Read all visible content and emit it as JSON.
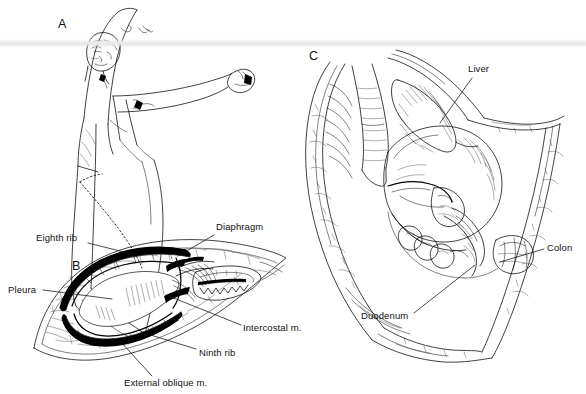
{
  "figure": {
    "kind": "medical-illustration",
    "background_color": "#ffffff",
    "ink_color": "#111111",
    "width": 586,
    "height": 394
  },
  "panels": [
    {
      "id": "A",
      "letter": "A",
      "letter_x": 58,
      "letter_y": 28,
      "name": "patient-positioning",
      "caption": ""
    },
    {
      "id": "B",
      "letter": "B",
      "letter_x": 72,
      "letter_y": 270,
      "name": "incision-cross-section",
      "caption": ""
    },
    {
      "id": "C",
      "letter": "C",
      "letter_x": 309,
      "letter_y": 60,
      "name": "open-surgical-field",
      "caption": ""
    }
  ],
  "annotations": [
    {
      "id": "eighth-rib",
      "text": "Eighth rib",
      "panel": "B",
      "label_x": 36,
      "label_y": 233,
      "anchor": "start",
      "leader": [
        [
          88,
          243
        ],
        [
          132,
          254
        ]
      ]
    },
    {
      "id": "diaphragm",
      "text": "Diaphragm",
      "panel": "B",
      "label_x": 216,
      "label_y": 222,
      "anchor": "start",
      "leader": [
        [
          214,
          235
        ],
        [
          178,
          256
        ]
      ]
    },
    {
      "id": "pleura",
      "text": "Pleura",
      "panel": "B",
      "label_x": 8,
      "label_y": 285,
      "anchor": "start",
      "leader": [
        [
          43,
          290
        ],
        [
          112,
          299
        ]
      ]
    },
    {
      "id": "intercostal-m",
      "text": "Intercostal m.",
      "panel": "B",
      "label_x": 243,
      "label_y": 323,
      "anchor": "start",
      "leader": [
        [
          241,
          325
        ],
        [
          166,
          295
        ]
      ]
    },
    {
      "id": "ninth-rib",
      "text": "Ninth rib",
      "panel": "B",
      "label_x": 199,
      "label_y": 348,
      "anchor": "start",
      "leader": [
        [
          196,
          349
        ],
        [
          141,
          332
        ]
      ]
    },
    {
      "id": "external-oblique-m",
      "text": "External oblique m.",
      "panel": "B",
      "label_x": 124,
      "label_y": 378,
      "anchor": "start",
      "leader": [
        [
          152,
          376
        ],
        [
          119,
          340
        ]
      ]
    },
    {
      "id": "liver",
      "text": "Liver",
      "panel": "C",
      "label_x": 468,
      "label_y": 64,
      "anchor": "start",
      "leader": [
        [
          472,
          78
        ],
        [
          440,
          123
        ]
      ]
    },
    {
      "id": "colon",
      "text": "Colon",
      "panel": "C",
      "label_x": 547,
      "label_y": 243,
      "anchor": "start",
      "leader": [
        [
          544,
          249
        ],
        [
          500,
          262
        ]
      ]
    },
    {
      "id": "duodenum",
      "text": "Duodenum",
      "panel": "C",
      "label_x": 361,
      "label_y": 311,
      "anchor": "start",
      "leader": [
        [
          414,
          313
        ],
        [
          475,
          265
        ]
      ]
    }
  ],
  "artifacts": [
    {
      "id": "scan-band",
      "name": "horizontal-scan-artifact",
      "top": 39,
      "height": 9,
      "color": "#ececec",
      "opacity": 0.85
    }
  ]
}
